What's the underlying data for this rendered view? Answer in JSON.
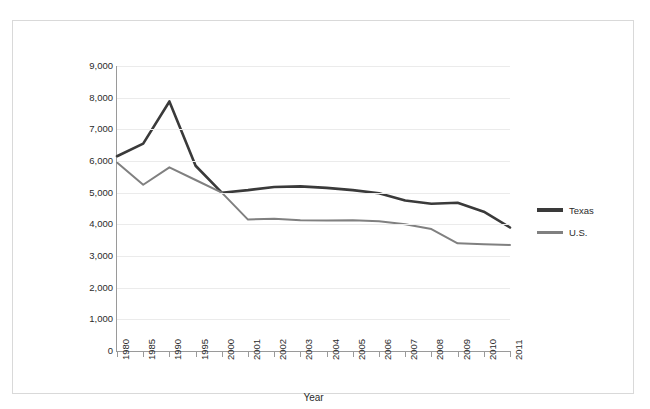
{
  "chart_data": {
    "type": "line",
    "title": "",
    "xlabel": "Year",
    "ylabel": "",
    "grid": true,
    "legend_position": "right",
    "categories": [
      "1980",
      "1985",
      "1990",
      "1995",
      "2000",
      "2001",
      "2002",
      "2003",
      "2004",
      "2005",
      "2006",
      "2007",
      "2008",
      "2009",
      "2010",
      "2011"
    ],
    "ylim": [
      0,
      9000
    ],
    "ytick_labels": [
      "9,000",
      "8,000",
      "7,000",
      "6,000",
      "5,000",
      "4,000",
      "3,000",
      "2,000",
      "1,000",
      "0"
    ],
    "ytick_values": [
      9000,
      8000,
      7000,
      6000,
      5000,
      4000,
      3000,
      2000,
      1000,
      0
    ],
    "series": [
      {
        "name": "Texas",
        "color": "#3a3a3a",
        "values": [
          6150,
          6550,
          7880,
          5850,
          5000,
          5080,
          5180,
          5200,
          5150,
          5080,
          4980,
          4750,
          4650,
          4680,
          4400,
          3900
        ]
      },
      {
        "name": "U.S.",
        "color": "#808080",
        "values": [
          5950,
          5250,
          5800,
          5400,
          5000,
          4150,
          4180,
          4130,
          4120,
          4130,
          4100,
          4000,
          3850,
          3400,
          3370,
          3350
        ]
      }
    ]
  },
  "legend": {
    "items": [
      {
        "label": "Texas"
      },
      {
        "label": "U.S."
      }
    ]
  }
}
